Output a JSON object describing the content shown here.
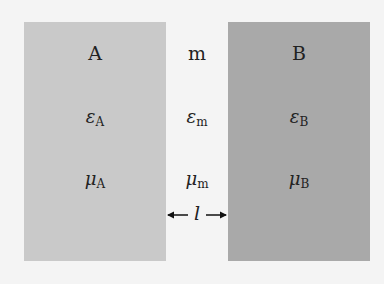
{
  "regions": [
    {
      "id": "A",
      "title": "A",
      "epsilon_symbol": "ε",
      "epsilon_sub": "A",
      "mu_symbol": "μ",
      "mu_sub": "A",
      "color": "#c9c9c9"
    },
    {
      "id": "m",
      "title": "m",
      "epsilon_symbol": "ε",
      "epsilon_sub": "m",
      "mu_symbol": "μ",
      "mu_sub": "m"
    },
    {
      "id": "B",
      "title": "B",
      "epsilon_symbol": "ε",
      "epsilon_sub": "B",
      "mu_symbol": "μ",
      "mu_sub": "B",
      "color": "#a9a9a9"
    }
  ],
  "gap": {
    "label": "l"
  }
}
